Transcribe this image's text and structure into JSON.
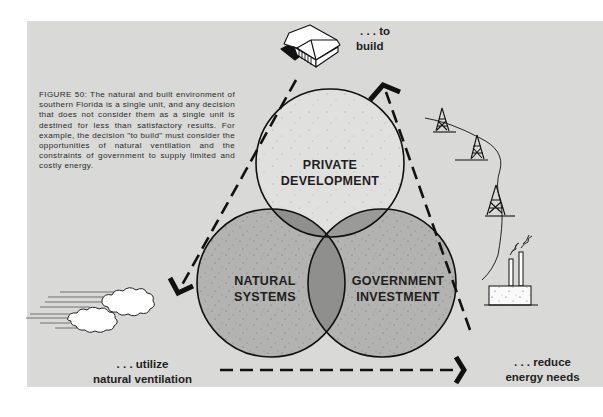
{
  "figure": {
    "caption": "FIGURE 50: The natural and built environment of southern Florida is a single unit, and any decision that does not consider them as a single unit is destined for less than satisfactory results. For example, the decision \"to build\" must consider the opportunities of natural ventilation and the constraints of government to supply limited and costly energy."
  },
  "venn": {
    "circles": [
      {
        "id": "private",
        "line1": "PRIVATE",
        "line2": "DEVELOPMENT"
      },
      {
        "id": "natural",
        "line1": "NATURAL",
        "line2": "SYSTEMS"
      },
      {
        "id": "government",
        "line1": "GOVERNMENT",
        "line2": "INVESTMENT"
      }
    ]
  },
  "actions": {
    "build": {
      "line1": ". . . to",
      "line2": "build",
      "icon": "house-icon"
    },
    "ventilation": {
      "line1": ". . . utilize",
      "line2": "natural ventilation",
      "icon": "wind-clouds-icon"
    },
    "energy": {
      "line1": ". . . reduce",
      "line2": "energy needs",
      "icon": "power-plant-icon"
    }
  },
  "colors": {
    "background": "#d9d9d7",
    "private_circle": "#e0e0de",
    "lower_circles": "#b3b3b1",
    "overlap": "#8f8f8d",
    "center_overlap": "#858583",
    "ink": "#111111"
  }
}
